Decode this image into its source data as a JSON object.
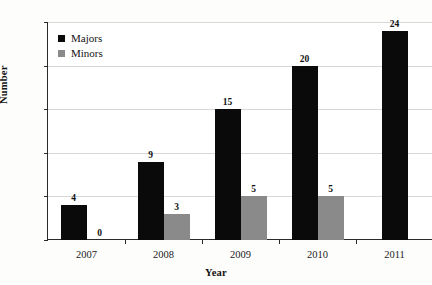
{
  "chart_data": {
    "type": "bar",
    "title": "",
    "xlabel": "Year",
    "ylabel": "Number",
    "categories": [
      "2007",
      "2008",
      "2009",
      "2010",
      "2011"
    ],
    "series": [
      {
        "name": "Majors",
        "color": "#0a0a0a",
        "values": [
          4,
          9,
          15,
          20,
          24
        ]
      },
      {
        "name": "Minors",
        "color": "#8a8a8a",
        "values": [
          0,
          3,
          5,
          5,
          null
        ]
      }
    ],
    "ylim": [
      0,
      25
    ],
    "yticks": [
      "0",
      "5",
      "10",
      "15",
      "20",
      "25"
    ],
    "grid": true,
    "legend_position": "upper-left-inside",
    "data_labels": {
      "2007": {
        "Majors": "4",
        "Minors": "0"
      },
      "2008": {
        "Majors": "9",
        "Minors": "3"
      },
      "2009": {
        "Majors": "15",
        "Minors": "5"
      },
      "2010": {
        "Majors": "20",
        "Minors": "5"
      },
      "2011": {
        "Majors": "24",
        "Minors": ""
      }
    }
  }
}
